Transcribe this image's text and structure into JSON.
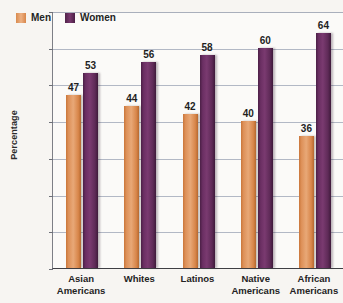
{
  "chart_data": {
    "type": "bar",
    "title": "",
    "subtitle": "",
    "xlabel": "",
    "ylabel": "Percentage",
    "categories": [
      "Asian Americans",
      "Whites",
      "Latinos",
      "Native Americans",
      "African Americans"
    ],
    "category_lines": [
      [
        "Asian",
        "Americans"
      ],
      [
        "Whites",
        ""
      ],
      [
        "Latinos",
        ""
      ],
      [
        "Native",
        "Americans"
      ],
      [
        "African",
        "Americans"
      ]
    ],
    "series": [
      {
        "name": "Men",
        "color": "#e09a63",
        "values": [
          47,
          44,
          42,
          40,
          36
        ]
      },
      {
        "name": "Women",
        "color": "#6b2f63",
        "values": [
          53,
          56,
          58,
          60,
          64
        ]
      }
    ],
    "ylim": [
      0,
      70
    ],
    "y_tick_step": 10,
    "y_tick_labels": [
      "70%",
      "60%",
      "50%",
      "40%",
      "30%",
      "20%",
      "10%",
      "0%"
    ],
    "y_tick_values": [
      70,
      60,
      50,
      40,
      30,
      20,
      10,
      0
    ],
    "grid": "horizontal",
    "legend_position": "top-left",
    "value_labels": "above-bar",
    "axis_color": "#3f3f44",
    "grid_color": "#9aa2b4",
    "background_color": "#f7f5f2",
    "plot_background_color": "#fbfaf8"
  },
  "legend": {
    "items": [
      {
        "label": "Men",
        "swatch": "men-color-swatch"
      },
      {
        "label": "Women",
        "swatch": "women-color-swatch"
      }
    ]
  }
}
